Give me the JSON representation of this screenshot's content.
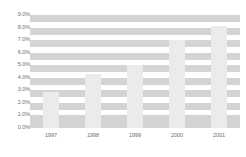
{
  "chart_data": {
    "type": "bar",
    "title": "",
    "xlabel": "",
    "ylabel": "",
    "categories": [
      "1997",
      "1998",
      "1999",
      "2000",
      "2001"
    ],
    "values": [
      2.9,
      4.3,
      5.0,
      7.0,
      8.1
    ],
    "ylim": [
      0.0,
      9.0
    ],
    "ytick_step": 1.0,
    "ytick_labels": [
      "9.0%",
      "8.0%",
      "7.0%",
      "6.0%",
      "5.0%",
      "4.0%",
      "3.0%",
      "2.0%",
      "1.0%",
      "0.0%"
    ],
    "ytick_values": [
      9.0,
      8.0,
      7.0,
      6.0,
      5.0,
      4.0,
      3.0,
      2.0,
      1.0,
      0.0
    ],
    "grid": true,
    "grid_orientation": "horizontal",
    "legend": false,
    "legend_position": "none",
    "series": [
      {
        "name": "",
        "values": [
          2.9,
          4.3,
          5.0,
          7.0,
          8.1
        ]
      }
    ],
    "colors": {
      "bar": "#ebebeb",
      "gridband": "#d4d4d4",
      "background": "#ffffff",
      "tick_label": "#6e6e6e"
    }
  }
}
